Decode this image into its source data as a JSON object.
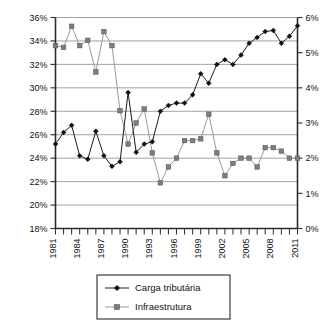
{
  "chart_data": {
    "type": "line",
    "title": "",
    "subtitle": "",
    "xlabel": "",
    "ylabel": "",
    "grid": true,
    "legend_position": "bottom",
    "x": [
      1981,
      1982,
      1983,
      1984,
      1985,
      1986,
      1987,
      1988,
      1989,
      1990,
      1991,
      1992,
      1993,
      1994,
      1995,
      1996,
      1997,
      1998,
      1999,
      2000,
      2001,
      2002,
      2003,
      2004,
      2005,
      2006,
      2007,
      2008,
      2009,
      2010,
      2011
    ],
    "x_tick_labels": [
      "1981",
      "1984",
      "1987",
      "1990",
      "1993",
      "1996",
      "1999",
      "2002",
      "2005",
      "2008",
      "2011"
    ],
    "x_tick_years": [
      1981,
      1984,
      1987,
      1990,
      1993,
      1996,
      1999,
      2002,
      2005,
      2008,
      2011
    ],
    "xlim": [
      1981,
      2011
    ],
    "left_axis": {
      "name": "Carga tributária",
      "ylim": [
        18,
        36
      ],
      "tick_step": 2,
      "tick_labels": [
        "18%",
        "20%",
        "22%",
        "24%",
        "26%",
        "28%",
        "30%",
        "32%",
        "34%",
        "36%"
      ],
      "tick_values": [
        18,
        20,
        22,
        24,
        26,
        28,
        30,
        32,
        34,
        36
      ]
    },
    "right_axis": {
      "name": "Infraestrutura",
      "ylim": [
        0,
        6
      ],
      "tick_step": 1,
      "tick_labels": [
        "0%",
        "1%",
        "2%",
        "3%",
        "4%",
        "5%",
        "6%"
      ],
      "tick_values": [
        0,
        1,
        2,
        3,
        4,
        5,
        6
      ]
    },
    "series": [
      {
        "name": "Carga tributária",
        "axis": "left",
        "marker": "diamond",
        "color": "#111111",
        "values": [
          25.2,
          26.2,
          26.8,
          24.2,
          23.9,
          26.3,
          24.2,
          23.3,
          23.7,
          29.6,
          24.5,
          25.2,
          25.4,
          28.0,
          28.5,
          28.7,
          28.7,
          29.4,
          31.2,
          30.4,
          32.0,
          32.4,
          32.0,
          32.8,
          33.8,
          34.3,
          34.8,
          34.9,
          33.8,
          34.4,
          35.3
        ]
      },
      {
        "name": "Infraestrutura",
        "axis": "right",
        "marker": "square",
        "color": "#7d7d7d",
        "values": [
          5.2,
          5.15,
          5.75,
          5.2,
          5.35,
          4.45,
          5.6,
          5.2,
          3.35,
          2.4,
          3.0,
          3.4,
          2.15,
          1.3,
          1.75,
          2.0,
          2.5,
          2.5,
          2.55,
          3.25,
          2.15,
          1.5,
          1.85,
          2.0,
          2.0,
          1.75,
          2.3,
          2.3,
          2.2,
          2.0,
          2.0
        ]
      }
    ]
  },
  "legend": {
    "items": [
      {
        "label": "Carga tributária",
        "marker": "diamond"
      },
      {
        "label": "Infraestrutura",
        "marker": "square"
      }
    ]
  }
}
